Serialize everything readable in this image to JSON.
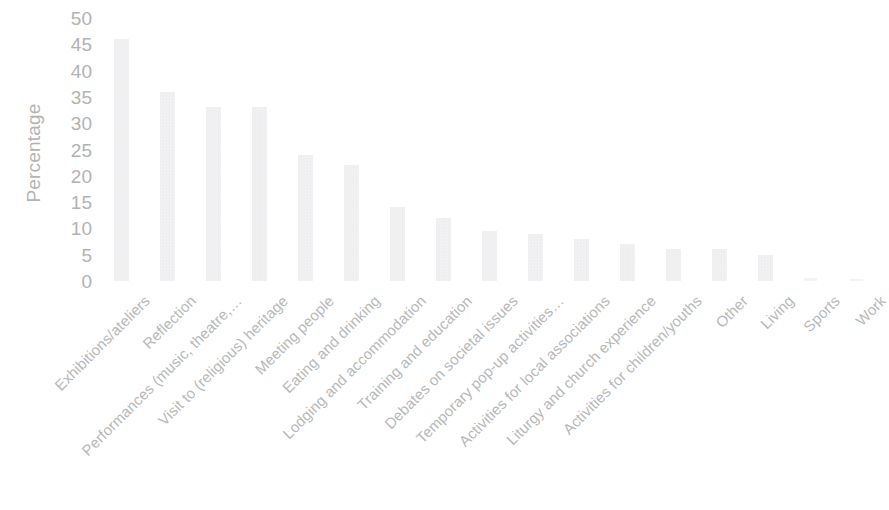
{
  "chart_data": {
    "type": "bar",
    "title": "",
    "xlabel": "",
    "ylabel": "Percentage",
    "ylim": [
      0,
      50
    ],
    "yticks": [
      50,
      45,
      40,
      35,
      30,
      25,
      20,
      15,
      10,
      5,
      0
    ],
    "grid": false,
    "legend": "none",
    "bar_color": "#eeeef0",
    "text_color": "#b5b5b5",
    "categories": [
      "Exhibitions/ateliers",
      "Reflection",
      "Performances (music, theatre,…",
      "Visit to (religious) heritage",
      "Meeting people",
      "Eating and drinking",
      "Lodging and accommodation",
      "Training and education",
      "Debates on societal issues",
      "Temporary pop-up activities…",
      "Activities for local associations",
      "Liturgy and church experience",
      "Activities for children/youths",
      "Other",
      "Living",
      "Sports",
      "Work"
    ],
    "values": [
      46,
      36,
      33,
      33,
      24,
      22,
      14,
      12,
      9.5,
      9,
      8,
      7,
      6,
      6,
      5,
      0.5,
      0.4
    ]
  }
}
